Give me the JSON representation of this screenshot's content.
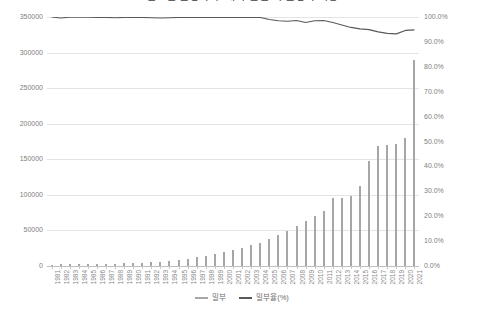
{
  "chart_data": {
    "type": "bar",
    "title": "연도별 출생아 수 대비 혼인 외 출생아 비중",
    "xlabel": "",
    "ylabel": "",
    "ylim": [
      0,
      350000
    ],
    "y2lim": [
      0,
      1.0
    ],
    "grid": true,
    "legend_position": "bottom",
    "categories": [
      "1981",
      "1982",
      "1983",
      "1984",
      "1985",
      "1986",
      "1987",
      "1988",
      "1989",
      "1990",
      "1991",
      "1992",
      "1993",
      "1994",
      "1995",
      "1996",
      "1997",
      "1998",
      "1999",
      "2000",
      "2001",
      "2002",
      "2003",
      "2004",
      "2005",
      "2006",
      "2007",
      "2008",
      "2009",
      "2010",
      "2011",
      "2012",
      "2013",
      "2014",
      "2015",
      "2016",
      "2017",
      "2018",
      "2019",
      "2020",
      "2021"
    ],
    "y_ticks_left": [
      "0",
      "50000",
      "100000",
      "150000",
      "200000",
      "250000",
      "300000",
      "350000"
    ],
    "y_ticks_right": [
      "0.0%",
      "10.0%",
      "20.0%",
      "30.0%",
      "40.0%",
      "50.0%",
      "60.0%",
      "70.0%",
      "80.0%",
      "90.0%",
      "100.0%"
    ],
    "series": [
      {
        "name": "밀부",
        "type": "bar",
        "axis": "left",
        "color": "#a6a6a6",
        "values": [
          2000,
          2200,
          2400,
          2600,
          2800,
          3000,
          3200,
          3500,
          3800,
          4200,
          4600,
          5200,
          6000,
          7000,
          8500,
          10000,
          12000,
          14000,
          16500,
          19000,
          22000,
          25000,
          29000,
          33000,
          38000,
          43000,
          49000,
          56000,
          63000,
          71000,
          78000,
          95000,
          96000,
          99000,
          112000,
          147000,
          168000,
          170000,
          172000,
          180000,
          290000
        ]
      },
      {
        "name": "밀부율(%)",
        "type": "line",
        "axis": "right",
        "color": "#595959",
        "values": [
          1.0,
          0.996,
          0.999,
          0.999,
          0.999,
          0.998,
          0.998,
          0.997,
          0.998,
          0.998,
          0.998,
          0.997,
          0.996,
          0.997,
          0.998,
          0.998,
          0.998,
          0.998,
          0.998,
          0.998,
          0.998,
          0.998,
          0.998,
          0.998,
          0.99,
          0.985,
          0.983,
          0.986,
          0.978,
          0.985,
          0.986,
          0.978,
          0.968,
          0.958,
          0.952,
          0.949,
          0.94,
          0.934,
          0.932,
          0.946,
          0.948
        ]
      }
    ],
    "line_rate_points_percent": [
      100.0,
      99.6,
      99.9,
      99.9,
      99.9,
      99.8,
      99.8,
      99.7,
      99.8,
      99.8,
      99.8,
      99.7,
      99.6,
      99.7,
      99.8,
      99.8,
      99.8,
      99.8,
      99.8,
      99.8,
      99.8,
      99.8,
      99.8,
      99.8,
      99.0,
      98.5,
      98.3,
      98.6,
      97.8,
      98.5,
      98.6,
      97.8,
      96.8,
      95.8,
      95.2,
      94.9,
      94.0,
      93.4,
      93.2,
      94.6,
      94.8
    ]
  },
  "legend": {
    "items": [
      {
        "label": "밀부",
        "color": "#a6a6a6"
      },
      {
        "label": "밀부율(%)",
        "color": "#595959"
      }
    ]
  }
}
